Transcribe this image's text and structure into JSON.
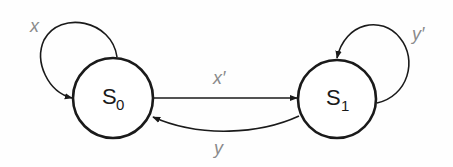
{
  "diagram": {
    "type": "state-machine",
    "colors": {
      "stroke": "#1a1a1a",
      "label": "#8a8a8a",
      "background": "#ffffff"
    },
    "states": [
      {
        "id": "S0",
        "label": "S",
        "subscript": "0",
        "cx": 113,
        "cy": 98,
        "r": 40
      },
      {
        "id": "S1",
        "label": "S",
        "subscript": "1",
        "cx": 337,
        "cy": 99,
        "r": 39
      }
    ],
    "transitions": [
      {
        "from": "S0",
        "to": "S0",
        "label": "x"
      },
      {
        "from": "S0",
        "to": "S1",
        "label": "x′"
      },
      {
        "from": "S1",
        "to": "S0",
        "label": "y"
      },
      {
        "from": "S1",
        "to": "S1",
        "label": "y′"
      }
    ]
  }
}
